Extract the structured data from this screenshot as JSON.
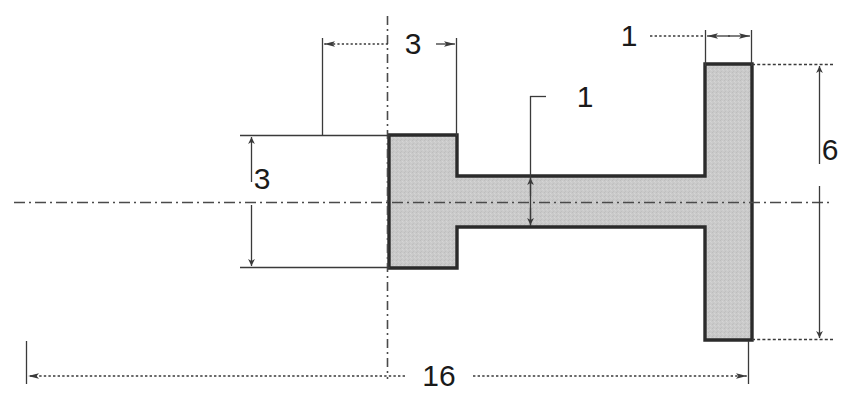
{
  "drawing": {
    "type": "engineering-section-view",
    "title": "",
    "units": "",
    "fill_color": "#c9c9c9",
    "outline_color": "#2b2b2b",
    "dimension_color": "#3a3a3a",
    "centerline_color": "#4a4a4a",
    "background_color": "#ffffff",
    "dimensions": [
      {
        "id": "left-flange-offset",
        "label": "3",
        "orientation": "horizontal",
        "position": "top-left",
        "description": "horizontal distance left of vertical centerline"
      },
      {
        "id": "right-flange-thickness",
        "label": "1",
        "orientation": "horizontal",
        "position": "top-right",
        "description": "thickness of right flange"
      },
      {
        "id": "web-thickness",
        "label": "1",
        "orientation": "vertical",
        "position": "center",
        "description": "thickness of horizontal web"
      },
      {
        "id": "left-flange-height",
        "label": "3",
        "orientation": "vertical",
        "position": "left",
        "description": "total height of left flange"
      },
      {
        "id": "right-flange-height",
        "label": "6",
        "orientation": "vertical",
        "position": "right",
        "description": "total height of right flange"
      },
      {
        "id": "overall-length",
        "label": "16",
        "orientation": "horizontal",
        "position": "bottom",
        "description": "overall horizontal length"
      }
    ],
    "centerlines": [
      {
        "id": "horizontal-centerline",
        "orientation": "horizontal"
      },
      {
        "id": "vertical-centerline",
        "orientation": "vertical"
      }
    ]
  }
}
